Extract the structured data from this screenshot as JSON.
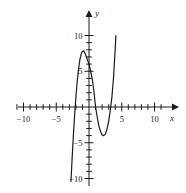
{
  "chart_data": {
    "type": "line",
    "title": "",
    "subtitle": "",
    "xlabel": "x",
    "ylabel": "y",
    "xlim": [
      -11.5,
      11.5
    ],
    "ylim": [
      -11.0,
      11.5
    ],
    "grid": false,
    "legend": "none",
    "x_major_ticks": [
      -10,
      -5,
      5,
      10
    ],
    "x_major_tick_labels": [
      "−10",
      "−5",
      "5",
      "10"
    ],
    "x_minor_tick_step": 1,
    "y_major_ticks": [
      10,
      5,
      -5,
      -10
    ],
    "y_major_tick_labels": [
      "10",
      "5",
      "−5",
      "−10"
    ],
    "y_minor_tick_step": 1,
    "axis_arrows": [
      "x-positive",
      "y-positive"
    ],
    "curve_color": "#1a1a1a",
    "axis_color": "#1a1a1a",
    "series": [
      {
        "name": "cubic",
        "roots": [
          -2.2,
          1.0,
          3.5
        ],
        "y_intercept": 6.0,
        "local_max": {
          "x": -0.8,
          "y": 7.8
        },
        "local_min": {
          "x": 2.3,
          "y": -4.0
        },
        "x": [
          -2.75,
          -2.6,
          -2.4,
          -2.2,
          -2.0,
          -1.8,
          -1.6,
          -1.4,
          -1.2,
          -1.0,
          -0.8,
          -0.6,
          -0.4,
          -0.2,
          0.0,
          0.25,
          0.5,
          0.75,
          1.0,
          1.25,
          1.5,
          1.75,
          2.0,
          2.25,
          2.5,
          2.75,
          3.0,
          3.25,
          3.5,
          3.75,
          4.0,
          4.1
        ],
        "y": [
          -10.4,
          -7.6,
          -4.2,
          -1.2,
          1.4,
          3.6,
          5.3,
          6.6,
          7.4,
          7.8,
          7.85,
          7.5,
          7.0,
          6.5,
          6.0,
          5.0,
          3.9,
          2.2,
          0.0,
          -1.4,
          -2.6,
          -3.4,
          -3.9,
          -4.0,
          -3.8,
          -3.1,
          -2.0,
          -0.5,
          1.4,
          4.2,
          8.1,
          10.0
        ]
      }
    ]
  },
  "axis_labels": {
    "x": "x",
    "y": "y"
  }
}
